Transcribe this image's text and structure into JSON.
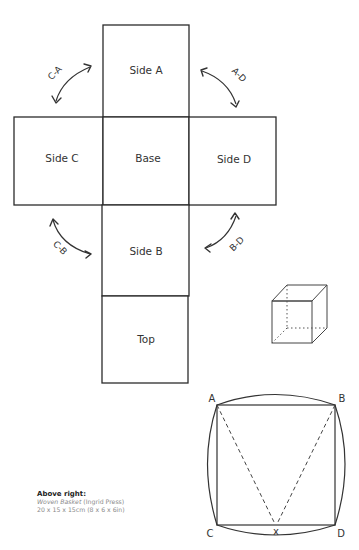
{
  "net": {
    "faces": {
      "side_a": "Side A",
      "side_c": "Side C",
      "base": "Base",
      "side_d": "Side D",
      "side_b": "Side B",
      "top": "Top"
    },
    "fold_arrows": {
      "c_a": "C-A",
      "a_d": "A-D",
      "c_b": "C-B",
      "b_d": "B-D"
    }
  },
  "cube_icon": "cube-wireframe-icon",
  "geometry": {
    "labels": {
      "a": "A",
      "b": "B",
      "c": "C",
      "d": "D",
      "x": "x"
    }
  },
  "caption": {
    "title": "Above right:",
    "work_title": "Woven Basket",
    "artist": " (Ingrid Press)",
    "dimensions": "20 x 15 x 15cm (8 x 6 x 6in)"
  }
}
